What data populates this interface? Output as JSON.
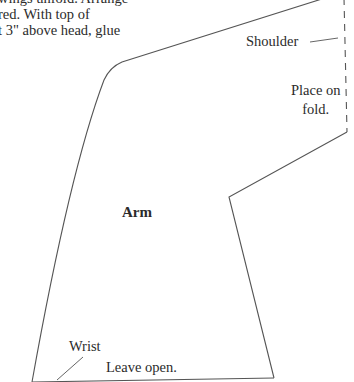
{
  "instructions": {
    "lines": [
      "wings unfold. Arrange",
      "red. With top of",
      "t 3\" above head, glue"
    ]
  },
  "labels": {
    "shoulder": "Shoulder",
    "place_on_fold_line1": "Place on",
    "place_on_fold_line2": "fold.",
    "piece_name": "Arm",
    "wrist": "Wrist",
    "leave_open": "Leave open."
  },
  "colors": {
    "outline": "#555555",
    "text": "#2b2b2b",
    "background": "#ffffff"
  }
}
